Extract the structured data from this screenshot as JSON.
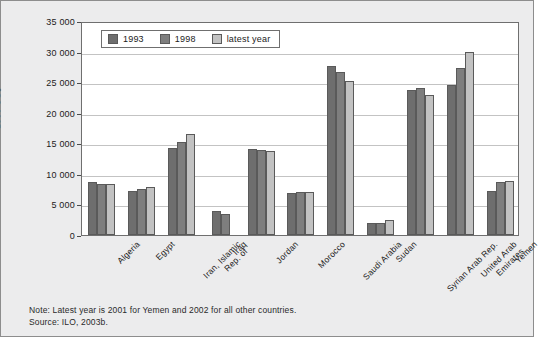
{
  "figure": {
    "background_color": "#ececed",
    "plot_background_color": "#ffffff",
    "frame_color": "#6f6f6f"
  },
  "axis": {
    "y_title": "1990 US$",
    "y_ticks": [
      "35 000",
      "30 000",
      "25 000",
      "20 000",
      "15 000",
      "10 000",
      "5 000",
      "0"
    ]
  },
  "legend": {
    "entries": [
      {
        "label": "1993",
        "color": "#6e6e6e"
      },
      {
        "label": "1998",
        "color": "#7e7e7e"
      },
      {
        "label": "latest year",
        "color": "#c2c2c2"
      }
    ]
  },
  "notes": {
    "note": "Note: Latest year is 2001 for Yemen and 2002 for all other countries.",
    "source": "Source: ILO, 2003b."
  },
  "chart_data": {
    "type": "bar",
    "title": "",
    "xlabel": "",
    "ylabel": "1990 US$",
    "ylim": [
      0,
      35000
    ],
    "ytick_interval": 5000,
    "grid": true,
    "legend_position": "top-left-inside",
    "categories": [
      "Algeria",
      "Egypt",
      "Iran, Islamic\nRep. of",
      "Iraq",
      "Jordan",
      "Morocco",
      "Saudi Arabia",
      "Sudan",
      "Syrian Arab Rep.",
      "United Arab\nEmirates",
      "Yemen"
    ],
    "series": [
      {
        "name": "1993",
        "color": "#6e6e6e",
        "values": [
          8600,
          7200,
          14200,
          3900,
          14000,
          6800,
          27600,
          1900,
          23700,
          24500,
          7200
        ]
      },
      {
        "name": "1998",
        "color": "#7e7e7e",
        "values": [
          8300,
          7500,
          15200,
          3500,
          13900,
          7000,
          26700,
          2000,
          24100,
          27300,
          8600
        ]
      },
      {
        "name": "latest year",
        "color": "#c2c2c2",
        "values": [
          8300,
          7900,
          16500,
          null,
          13700,
          7000,
          25200,
          2400,
          22900,
          30000,
          8900
        ]
      }
    ]
  }
}
